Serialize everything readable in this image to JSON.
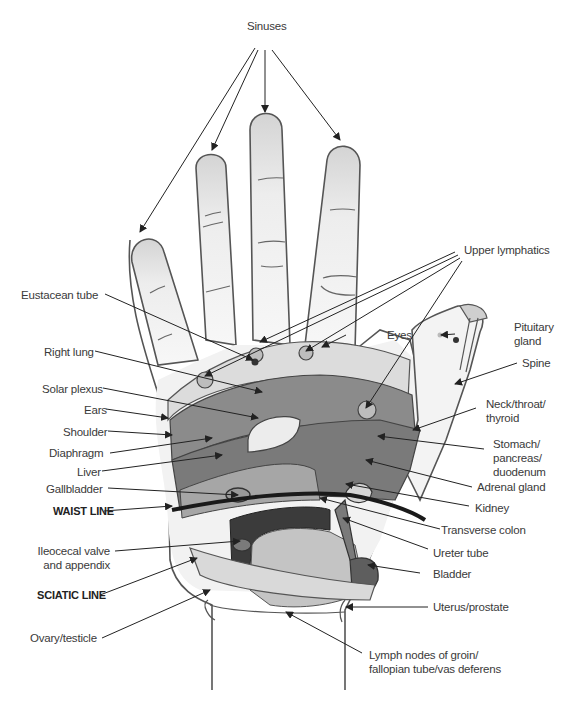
{
  "diagram": {
    "type": "hand reflexology map (palm view, right hand)",
    "colors": {
      "outline": "#555555",
      "skin": "#f2f2f2",
      "fingertip": "#d8d8d8",
      "band_upper": "#8a8a8a",
      "band_mid": "#777777",
      "band_dark": "#3d3d3d",
      "light_zone": "#c8c8c8",
      "pale_zone": "#e0e0e0"
    }
  },
  "labels": {
    "top": {
      "sinuses": "Sinuses"
    },
    "left": {
      "eustacean_tube": "Eustacean tube",
      "right_lung": "Right lung",
      "solar_plexus": "Solar plexus",
      "ears": "Ears",
      "shoulder": "Shoulder",
      "diaphragm": "Diaphragm",
      "liver": "Liver",
      "gallbladder": "Gallbladder",
      "waist_line": "WAIST LINE",
      "ileocecal_1": "Ileocecal valve",
      "ileocecal_2": "and appendix",
      "sciatic_line": "SCIATIC LINE",
      "ovary_testicle": "Ovary/testicle"
    },
    "right": {
      "upper_lymphatics": "Upper lymphatics",
      "eyes": "Eyes",
      "pituitary_1": "Pituitary",
      "pituitary_2": "gland",
      "spine": "Spine",
      "neck_1": "Neck/throat/",
      "neck_2": "thyroid",
      "stomach_1": "Stomach/",
      "stomach_2": "pancreas/",
      "stomach_3": "duodenum",
      "adrenal_gland": "Adrenal gland",
      "kidney": "Kidney",
      "transverse_colon": "Transverse colon",
      "ureter_tube": "Ureter tube",
      "bladder": "Bladder",
      "uterus_prostate": "Uterus/prostate"
    },
    "bottom": {
      "lymph_1": "Lymph nodes of groin/",
      "lymph_2": "fallopian tube/vas deferens"
    }
  }
}
